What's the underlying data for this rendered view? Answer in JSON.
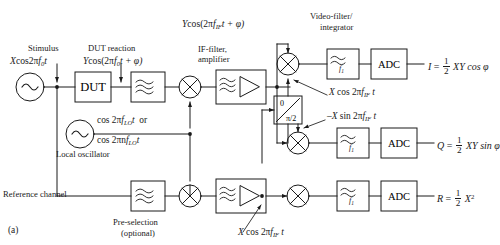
{
  "figure": {
    "caption": "(a)",
    "type": "block-diagram",
    "title_implicit": "Heterodyne I/Q receiver block diagram"
  },
  "colors": {
    "line": "#1a1a1a",
    "text": "#1a1a1a",
    "background": "#ffffff"
  },
  "annotations": {
    "stimulus": "Stimulus",
    "stimulus_signal": {
      "amp": "X",
      "expr": "cos2π",
      "freq": "f",
      "freq_sub": "0",
      "tail": "t"
    },
    "dut_reaction": "DUT reaction",
    "dut_signal": {
      "amp": "Y",
      "expr": "cos(2π",
      "freq": "f",
      "freq_sub": "0",
      "tail": "t + φ)"
    },
    "if_signal": {
      "amp": "Y",
      "expr": "cos(2π",
      "freq": "f",
      "freq_sub": "IF",
      "tail": "t + φ)"
    },
    "if_filter_amplifier": "IF-filter,\namplifier",
    "if_filter_line1": "IF-filter,",
    "if_filter_line2": "amplifier",
    "video_filter_line1": "Video-filter/",
    "video_filter_line2": "integrator",
    "local_oscillator": "Local oscillator",
    "lo_signal_line1": {
      "expr": "cos 2π",
      "freq": "f",
      "freq_sub": "LO",
      "tail": "t",
      "or": "or"
    },
    "lo_signal_line2": {
      "expr": "cos 2πn",
      "freq": "f",
      "freq_sub": "LO",
      "tail": "t"
    },
    "reference_channel": "Reference channel",
    "preselection_line1": "Pre-selection",
    "preselection_line2": "(optional)",
    "mixer_ref_cos_if": {
      "amp": "X",
      "expr": "cos 2π",
      "freq": "f",
      "freq_sub": "IF",
      "tail": "t"
    },
    "mixer_ref_sin_if": {
      "amp": "–X",
      "expr": "sin 2π",
      "freq": "f",
      "freq_sub": "IF",
      "tail": "t"
    },
    "mixer_ref_bottom": {
      "amp": "X",
      "expr": "cos 2π",
      "freq": "f",
      "freq_sub": "IF",
      "tail": "t"
    }
  },
  "blocks": {
    "dut": "DUT",
    "adc": "ADC",
    "phase_shifter": {
      "top": "0",
      "bottom": "π/2"
    },
    "video_filter_label": {
      "f": "f",
      "sub": "1"
    }
  },
  "outputs": [
    {
      "name": "I",
      "eq": "=",
      "num": "1",
      "den": "2",
      "expr": "XY cos φ"
    },
    {
      "name": "Q",
      "eq": "=",
      "num": "1",
      "den": "2",
      "expr": "XY sin φ"
    },
    {
      "name": "R",
      "eq": "=",
      "num": "1",
      "den": "2",
      "expr": "X",
      "sup": "2"
    }
  ],
  "icons": {
    "source": "sine-source-icon",
    "mixer": "mixer-multiplier-icon",
    "bandpass": "bandpass-filter-icon",
    "lowpass": "lowpass-filter-icon",
    "amplifier": "amplifier-triangle-icon",
    "phase": "phase-shifter-icon"
  }
}
